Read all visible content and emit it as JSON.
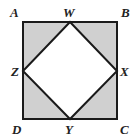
{
  "diagram": {
    "colors": {
      "shade": "#d0d0d0",
      "stroke": "#1a1a1a",
      "inner": "#ffffff"
    },
    "points": {
      "A": {
        "label": "A",
        "x": 23,
        "y": 22
      },
      "B": {
        "label": "B",
        "x": 117,
        "y": 22
      },
      "C": {
        "label": "C",
        "x": 117,
        "y": 119
      },
      "D": {
        "label": "D",
        "x": 23,
        "y": 119
      },
      "W": {
        "label": "W",
        "x": 70,
        "y": 22
      },
      "X": {
        "label": "X",
        "x": 117,
        "y": 71
      },
      "Y": {
        "label": "Y",
        "x": 70,
        "y": 119
      },
      "Z": {
        "label": "Z",
        "x": 23,
        "y": 71
      }
    }
  }
}
